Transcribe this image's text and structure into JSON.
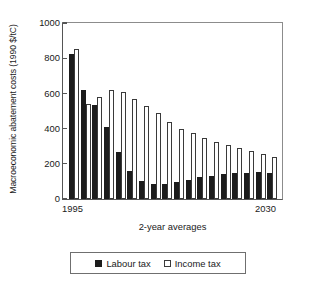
{
  "chart_data": {
    "type": "bar",
    "title": "",
    "xlabel": "2-year averages",
    "ylabel": "Macroeconomic abatement costs (1990 $/tC)",
    "ylim": [
      0,
      1000
    ],
    "yticks": [
      0,
      200,
      400,
      600,
      800,
      1000
    ],
    "ytick_labels": [
      "0",
      "200",
      "400",
      "600",
      "800",
      "1000"
    ],
    "grid": false,
    "legend_position": "bottom",
    "xtick_labels": [
      "1995",
      "2030"
    ],
    "categories": [
      "1995",
      "1997",
      "1999",
      "2001",
      "2003",
      "2005",
      "2007",
      "2009",
      "2011",
      "2013",
      "2015",
      "2017",
      "2019",
      "2021",
      "2023",
      "2025",
      "2027",
      "2029"
    ],
    "series": [
      {
        "name": "Labour tax",
        "color": "#1c1c1c",
        "values": [
          825,
          622,
          536,
          407,
          268,
          158,
          105,
          86,
          87,
          96,
          107,
          124,
          133,
          143,
          149,
          148,
          153,
          148
        ]
      },
      {
        "name": "Income tax",
        "color": "#ffffff",
        "values": [
          855,
          540,
          578,
          621,
          606,
          567,
          529,
          486,
          437,
          400,
          373,
          344,
          325,
          308,
          291,
          273,
          257,
          237
        ]
      }
    ]
  },
  "axes": {
    "ylabel": "Macroeconomic abatement costs (1990 $/tC)",
    "xlabel": "2-year averages",
    "xtick_start": "1995",
    "xtick_end": "2030",
    "ytick_0": "0",
    "ytick_200": "200",
    "ytick_400": "400",
    "ytick_600": "600",
    "ytick_800": "800",
    "ytick_1000": "1000"
  },
  "legend": {
    "labour_label": "Labour tax",
    "income_label": "Income tax"
  }
}
